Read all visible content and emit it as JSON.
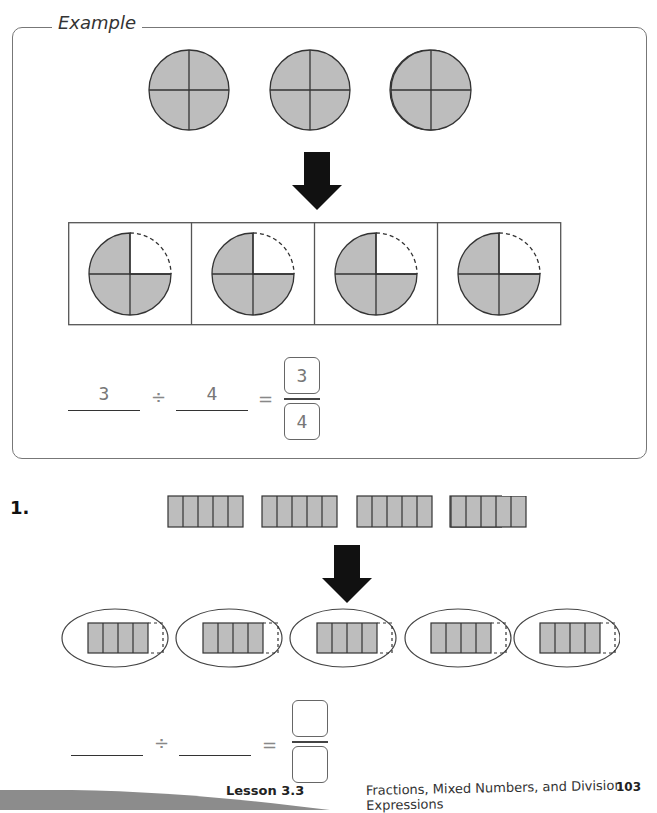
{
  "example": {
    "title": "Example",
    "whole_circles": [
      {
        "label": "circle-1",
        "parts": 4,
        "shaded": 4
      },
      {
        "label": "circle-2",
        "parts": 4,
        "shaded": 4
      },
      {
        "label": "circle-3",
        "parts": 4,
        "shaded": 4
      }
    ],
    "groups": [
      {
        "parts": 4,
        "shaded": 3
      },
      {
        "parts": 4,
        "shaded": 3
      },
      {
        "parts": 4,
        "shaded": 3
      },
      {
        "parts": 4,
        "shaded": 3
      }
    ],
    "equation": {
      "dividend": "3",
      "divide_symbol": "÷",
      "divisor": "4",
      "equals_symbol": "=",
      "numerator": "3",
      "denominator": "4"
    }
  },
  "problem_1": {
    "number": "1.",
    "bars": [
      {
        "parts": 5,
        "shaded": 5
      },
      {
        "parts": 5,
        "shaded": 5
      },
      {
        "parts": 5,
        "shaded": 5
      },
      {
        "parts": 5,
        "shaded": 5
      }
    ],
    "groups": [
      {
        "parts": 5,
        "shaded": 4
      },
      {
        "parts": 5,
        "shaded": 4
      },
      {
        "parts": 5,
        "shaded": 4
      },
      {
        "parts": 5,
        "shaded": 4
      },
      {
        "parts": 5,
        "shaded": 4
      }
    ],
    "equation": {
      "dividend": "",
      "divide_symbol": "÷",
      "divisor": "",
      "equals_symbol": "=",
      "numerator": "",
      "denominator": ""
    }
  },
  "footer": {
    "lesson": "Lesson 3.3",
    "title": "Fractions, Mixed Numbers, and Division Expressions",
    "page_number": "103"
  },
  "colors": {
    "shade": "#bdbdbd",
    "stroke": "#333333",
    "frame": "#777777"
  }
}
